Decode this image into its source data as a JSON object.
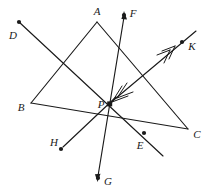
{
  "figure": {
    "kind": "geometry-diagram",
    "width": 209,
    "height": 196,
    "background_color": "#ffffff",
    "stroke_color": "#1a1a1a",
    "label_color": "#1a1a1a",
    "stroke_width": 1.1,
    "dot_radius": 2.1,
    "labels": {
      "A": "A",
      "B": "B",
      "C": "C",
      "D": "D",
      "E": "E",
      "F": "F",
      "G": "G",
      "H": "H",
      "K": "K",
      "P": "P"
    },
    "points": [
      {
        "id": "A",
        "label": "A",
        "x": 97,
        "y": 22,
        "dot": false,
        "label_x": 97,
        "label_y": 11
      },
      {
        "id": "B",
        "label": "B",
        "x": 31,
        "y": 103,
        "dot": false,
        "label_x": 21,
        "label_y": 107
      },
      {
        "id": "C",
        "label": "C",
        "x": 188,
        "y": 129,
        "dot": false,
        "label_x": 197,
        "label_y": 134
      },
      {
        "id": "D",
        "label": "D",
        "x": 19,
        "y": 22,
        "dot": true,
        "label_x": 13,
        "label_y": 35
      },
      {
        "id": "E",
        "label": "E",
        "x": 144,
        "y": 133,
        "dot": true,
        "label_x": 140,
        "label_y": 145
      },
      {
        "id": "F",
        "label": "F",
        "x": 124,
        "y": 15,
        "dot": true,
        "label_x": 133,
        "label_y": 13
      },
      {
        "id": "G",
        "label": "G",
        "x": 98,
        "y": 178,
        "dot": true,
        "label_x": 108,
        "label_y": 181
      },
      {
        "id": "H",
        "label": "H",
        "x": 61,
        "y": 149,
        "dot": true,
        "label_x": 54,
        "label_y": 142
      },
      {
        "id": "K",
        "label": "K",
        "x": 182,
        "y": 42,
        "dot": true,
        "label_x": 192,
        "label_y": 46
      },
      {
        "id": "P",
        "label": "P",
        "x": 110,
        "y": 104,
        "dot": true,
        "label_x": 101,
        "label_y": 104
      }
    ],
    "segments": [
      {
        "id": "side-AB",
        "name": "triangle-side-ab",
        "from": "A",
        "to": "B"
      },
      {
        "id": "side-BC",
        "name": "triangle-side-bc",
        "from": "B",
        "to": "C"
      },
      {
        "id": "side-CA",
        "name": "triangle-side-ca",
        "from": "C",
        "to": "A"
      },
      {
        "id": "line-DE",
        "name": "line-d-e",
        "from": "D",
        "to": "E",
        "extend_past_to": 23
      },
      {
        "id": "line-FG",
        "name": "line-f-g",
        "from": "F",
        "to": "G"
      },
      {
        "id": "ray-PK",
        "name": "ray-p-k",
        "from": "P",
        "to": "K"
      },
      {
        "id": "ray-PH",
        "name": "ray-p-h",
        "from": "P",
        "to": "H"
      }
    ],
    "arrow_marks": [
      {
        "id": "arrow-F",
        "name": "arrowhead-at-f",
        "on": "line-FG",
        "at": "F",
        "style": "single"
      },
      {
        "id": "arrow-G",
        "name": "arrowhead-at-g",
        "on": "line-FG",
        "at": "G",
        "style": "single"
      },
      {
        "id": "arrow-K-mid",
        "name": "double-arrowhead-toward-k",
        "on": "ray-PK",
        "at_x": 168,
        "at_y": 52,
        "style": "double"
      },
      {
        "id": "arrow-P-mid",
        "name": "double-arrowhead-toward-p",
        "on": "ray-PK",
        "at_x": 120,
        "at_y": 96,
        "style": "double"
      },
      {
        "id": "arrow-H",
        "name": "arrowhead-at-h",
        "on": "ray-PH",
        "at": "H",
        "style": "single"
      }
    ],
    "annotations": {
      "interior_point": "P",
      "concurrency_note": "Lines DE, FG, PK and PH all pass through P"
    }
  }
}
